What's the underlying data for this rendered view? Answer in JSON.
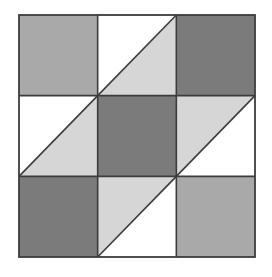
{
  "figure": {
    "type": "geometric-tiling",
    "background_color": "#ffffff",
    "line_color": "#3c3c3c",
    "grid": {
      "rows": 3,
      "cols": 3,
      "origin_x": 19,
      "origin_y": 15,
      "width": 236,
      "height": 242
    },
    "palette": {
      "white": "#ffffff",
      "light_gray": "#d6d6d6",
      "medium_gray": "#a9a9a9",
      "dark_gray": "#7b7b7b"
    },
    "palette_labels": {
      "white": "white",
      "light_gray": "light gray",
      "medium_gray": "medium gray",
      "dark_gray": "dark gray"
    },
    "cells": [
      {
        "row": 0,
        "col": 0,
        "name": "cell-r1c1",
        "kind": "solid",
        "fill": "#a9a9a9",
        "fill_label": "medium gray",
        "diagonal": "none",
        "upper_fill": "#a9a9a9",
        "lower_fill": "#a9a9a9"
      },
      {
        "row": 0,
        "col": 1,
        "name": "cell-r1c2",
        "kind": "split",
        "fill": "",
        "fill_label": "white over light gray",
        "diagonal": "bottom-left-to-top-right",
        "upper_fill": "#ffffff",
        "lower_fill": "#d6d6d6"
      },
      {
        "row": 0,
        "col": 2,
        "name": "cell-r1c3",
        "kind": "solid",
        "fill": "#7b7b7b",
        "fill_label": "dark gray",
        "diagonal": "none",
        "upper_fill": "#7b7b7b",
        "lower_fill": "#7b7b7b"
      },
      {
        "row": 1,
        "col": 0,
        "name": "cell-r2c1",
        "kind": "split",
        "fill": "",
        "fill_label": "white over light gray",
        "diagonal": "bottom-left-to-top-right",
        "upper_fill": "#ffffff",
        "lower_fill": "#d6d6d6"
      },
      {
        "row": 1,
        "col": 1,
        "name": "cell-r2c2",
        "kind": "solid",
        "fill": "#7b7b7b",
        "fill_label": "dark gray",
        "diagonal": "none",
        "upper_fill": "#7b7b7b",
        "lower_fill": "#7b7b7b"
      },
      {
        "row": 1,
        "col": 2,
        "name": "cell-r2c3",
        "kind": "split",
        "fill": "",
        "fill_label": "light gray over white",
        "diagonal": "bottom-left-to-top-right",
        "upper_fill": "#d6d6d6",
        "lower_fill": "#ffffff"
      },
      {
        "row": 2,
        "col": 0,
        "name": "cell-r3c1",
        "kind": "solid",
        "fill": "#7b7b7b",
        "fill_label": "dark gray",
        "diagonal": "none",
        "upper_fill": "#7b7b7b",
        "lower_fill": "#7b7b7b"
      },
      {
        "row": 2,
        "col": 1,
        "name": "cell-r3c2",
        "kind": "split",
        "fill": "",
        "fill_label": "light gray over white",
        "diagonal": "bottom-left-to-top-right",
        "upper_fill": "#d6d6d6",
        "lower_fill": "#ffffff"
      },
      {
        "row": 2,
        "col": 2,
        "name": "cell-r3c3",
        "kind": "solid",
        "fill": "#a9a9a9",
        "fill_label": "medium gray",
        "diagonal": "none",
        "upper_fill": "#a9a9a9",
        "lower_fill": "#a9a9a9"
      }
    ]
  }
}
